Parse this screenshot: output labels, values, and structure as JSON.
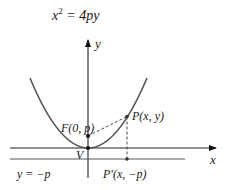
{
  "title": {
    "base": "x",
    "sup": "2",
    "rest": " = 4py"
  },
  "axes": {
    "x_label": "x",
    "y_label": "y"
  },
  "points": {
    "focus_label": "F(0, p)",
    "point_label": "P(x, y)",
    "vertex_label": "V",
    "projection_label": "P′(x, −p)"
  },
  "directrix": {
    "label": "y = −p"
  },
  "colors": {
    "curve": "#555555",
    "axis": "#222222",
    "line": "#444444"
  }
}
